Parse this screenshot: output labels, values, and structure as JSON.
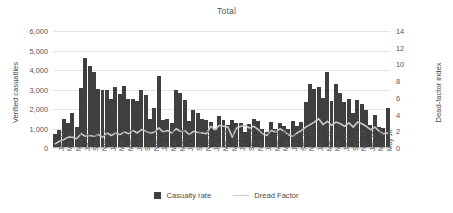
{
  "chart_data": {
    "type": "bar",
    "title": "Total",
    "xlabel": "",
    "ylabel": "Verified casualties",
    "y2label": "Dead-factor index",
    "ylim": [
      0,
      6000
    ],
    "y2lim": [
      0,
      14
    ],
    "yticks": [
      "0",
      "1,000",
      "2,000",
      "3,000",
      "4,000",
      "5,000",
      "6,000"
    ],
    "ytick_values": [
      0,
      1000,
      2000,
      3000,
      4000,
      5000,
      6000
    ],
    "y2ticks": [
      "0",
      "2",
      "4",
      "6",
      "8",
      "10",
      "12",
      "14"
    ],
    "y2tick_values": [
      0,
      2,
      4,
      6,
      8,
      10,
      12,
      14
    ],
    "grid": true,
    "legend_position": "bottom",
    "bar_color": "#3f3f3f",
    "line_color": "#c9c9c9",
    "categories": [
      "Jan 12",
      "Feb 12",
      "Mar 12",
      "Apr 12",
      "May 12",
      "Jun 12",
      "Jul 12",
      "Aug 12",
      "Sep 12",
      "Oct 12",
      "Nov 12",
      "Dec 12",
      "Jan 13",
      "Feb 13",
      "Mar 13",
      "Apr 13",
      "May 13",
      "Jun 13",
      "Jul 13",
      "Aug 13",
      "Sep 13",
      "Oct 13",
      "Nov 13",
      "Dec 13",
      "Jan 14",
      "Feb 14",
      "Mar 14",
      "Apr 14",
      "May 14",
      "Jun 14",
      "Jul 14",
      "Aug 14",
      "Sep 14",
      "Oct 14",
      "Nov 14",
      "Dec 14",
      "Jan 15",
      "Feb 15",
      "Mar 15",
      "Apr 15",
      "May 15",
      "Jun 15",
      "Jul 15",
      "Aug 15",
      "Sep 15",
      "Oct 15",
      "Nov 15",
      "Dec 15",
      "Jan 16",
      "Feb 16",
      "Mar 16",
      "Apr 16",
      "May 16",
      "Jun 16",
      "Jul 16",
      "Aug 16",
      "Sep 16",
      "Oct 16",
      "Nov 16",
      "Dec 16",
      "Jan 17",
      "Feb 17",
      "Mar 17",
      "Apr 17",
      "May 17",
      "Jun 17",
      "Jul 17",
      "Aug 17",
      "Sep 17",
      "Oct 17",
      "Nov 17",
      "Dec 17",
      "Jan 18",
      "Feb 18",
      "Mar 18",
      "Apr 18",
      "May 18",
      "Jun 18"
    ],
    "xtick_labels": [
      "Jan 12",
      "Mar 12",
      "May 12",
      "Jul 12",
      "Sep 12",
      "Nov 12",
      "Jan 13",
      "Mar 13",
      "May 13",
      "Jul 13",
      "Sep 13",
      "Nov 13",
      "Jan 14",
      "Mar 14",
      "May 14",
      "Jul 14",
      "Sep 14",
      "Nov 14",
      "Jan 15",
      "Mar 15",
      "May 15",
      "Jul 15",
      "Sep 15",
      "Nov 15",
      "Jan 16",
      "Mar 16",
      "May 16",
      "Jul 16",
      "Sep 16",
      "Nov 16",
      "Jan 17",
      "Mar 17",
      "May 17",
      "Jul 17",
      "Sep 17",
      "Nov 17",
      "Jan 18",
      "Mar 18",
      "May 18"
    ],
    "series": [
      {
        "name": "Casualty rate",
        "type": "bar",
        "axis": "left",
        "color": "#3f3f3f",
        "values": [
          700,
          900,
          1500,
          1300,
          1800,
          1100,
          3100,
          4600,
          4200,
          3900,
          3050,
          3000,
          3000,
          2500,
          3150,
          2750,
          3200,
          2500,
          2500,
          2400,
          2950,
          2700,
          1500,
          2050,
          3700,
          1450,
          1500,
          1300,
          2950,
          2800,
          2450,
          1400,
          1950,
          1800,
          1500,
          1450,
          1350,
          900,
          1650,
          1450,
          1200,
          1450,
          1300,
          1300,
          800,
          1250,
          1500,
          1400,
          1000,
          800,
          1350,
          1000,
          1300,
          1150,
          950,
          1400,
          1150,
          1350,
          2350,
          3300,
          3050,
          3150,
          2550,
          3900,
          2400,
          3300,
          2800,
          2350,
          2500,
          1800,
          2450,
          2250,
          1950,
          1200,
          1700,
          1100,
          1050,
          2050
        ]
      },
      {
        "name": "Dread Factor",
        "type": "line",
        "axis": "right",
        "color": "#c9c9c9",
        "values": [
          0.5,
          0.8,
          1.0,
          1.3,
          1.3,
          1.1,
          1.7,
          1.4,
          1.5,
          1.4,
          1.6,
          1.3,
          1.8,
          1.5,
          1.8,
          1.6,
          1.9,
          1.7,
          2.1,
          1.8,
          2.2,
          2.0,
          1.8,
          1.9,
          2.4,
          1.9,
          2.1,
          1.8,
          2.3,
          2.0,
          2.1,
          1.6,
          2.0,
          1.9,
          1.8,
          1.7,
          2.6,
          2.2,
          2.7,
          2.6,
          2.5,
          1.3,
          2.4,
          2.6,
          2.7,
          2.4,
          2.6,
          2.2,
          1.7,
          1.5,
          2.1,
          1.9,
          2.3,
          2.0,
          1.6,
          1.4,
          1.8,
          2.1,
          2.5,
          2.8,
          3.1,
          3.5,
          2.8,
          3.2,
          2.7,
          3.1,
          2.9,
          2.6,
          3.0,
          2.5,
          3.1,
          2.9,
          2.6,
          2.2,
          2.5,
          2.0,
          1.7,
          1.8
        ]
      }
    ]
  },
  "legend": {
    "items": [
      {
        "label": "Casualty rate",
        "marker": "bar-swatch-icon"
      },
      {
        "label": "Dread Factor",
        "marker": "line-swatch-icon"
      }
    ]
  }
}
